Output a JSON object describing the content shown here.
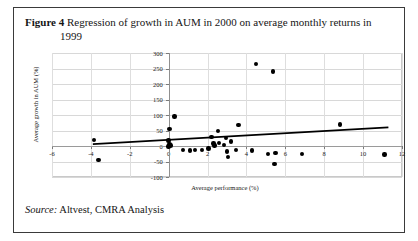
{
  "figure": {
    "label": "Figure 4",
    "caption_line1": "Regression of growth in AUM in 2000 on average monthly returns in",
    "caption_line2": "1999",
    "source_label": "Source:",
    "source_text": "Altvest, CMRA Analysis"
  },
  "chart_data": {
    "type": "scatter",
    "title": "Regression of growth in AUM in 2000 on average monthly returns in 1999",
    "xlabel": "Average performance  (%)",
    "ylabel": "Average growth in AUM (%)",
    "xlim": [
      -6,
      12
    ],
    "ylim": [
      -100,
      300
    ],
    "xticks": [
      -6,
      -4,
      -2,
      0,
      2,
      4,
      6,
      8,
      10,
      12
    ],
    "xtick_labels": [
      "-6",
      "-4",
      "-2",
      "0",
      "2",
      "4",
      "6",
      "8",
      "10",
      "12"
    ],
    "yticks": [
      -100,
      -50,
      0,
      50,
      100,
      150,
      200,
      250,
      300
    ],
    "ytick_labels": [
      "-100",
      "-50",
      "0",
      "50",
      "100",
      "150",
      "200",
      "250",
      "300"
    ],
    "grid": true,
    "legend": null,
    "points": [
      {
        "x": -3.85,
        "y": 20
      },
      {
        "x": -3.6,
        "y": -45
      },
      {
        "x": 0.05,
        "y": 55
      },
      {
        "x": 0.3,
        "y": 95
      },
      {
        "x": 0.0,
        "y": 18
      },
      {
        "x": 0.05,
        "y": 5
      },
      {
        "x": 0.1,
        "y": 2
      },
      {
        "x": 0.0,
        "y": -2
      },
      {
        "x": 0.75,
        "y": -12
      },
      {
        "x": 1.1,
        "y": -14
      },
      {
        "x": 1.35,
        "y": -13
      },
      {
        "x": 1.7,
        "y": -13
      },
      {
        "x": 2.05,
        "y": -8
      },
      {
        "x": 2.2,
        "y": 30
      },
      {
        "x": 2.3,
        "y": 8
      },
      {
        "x": 2.35,
        "y": 2
      },
      {
        "x": 2.55,
        "y": 48
      },
      {
        "x": 2.6,
        "y": 10
      },
      {
        "x": 2.85,
        "y": 3
      },
      {
        "x": 2.95,
        "y": 25
      },
      {
        "x": 3.0,
        "y": -18
      },
      {
        "x": 3.05,
        "y": -35
      },
      {
        "x": 3.2,
        "y": 14
      },
      {
        "x": 3.45,
        "y": -12
      },
      {
        "x": 3.6,
        "y": 68
      },
      {
        "x": 4.3,
        "y": -14
      },
      {
        "x": 4.5,
        "y": 265
      },
      {
        "x": 5.1,
        "y": -26
      },
      {
        "x": 5.35,
        "y": 240
      },
      {
        "x": 5.5,
        "y": -22
      },
      {
        "x": 5.45,
        "y": -58
      },
      {
        "x": 6.85,
        "y": -26
      },
      {
        "x": 8.8,
        "y": 70
      },
      {
        "x": 11.1,
        "y": -28
      }
    ],
    "trendline": {
      "x1": -3.9,
      "y1": 6,
      "x2": 11.3,
      "y2": 60,
      "color": "#000000"
    }
  }
}
